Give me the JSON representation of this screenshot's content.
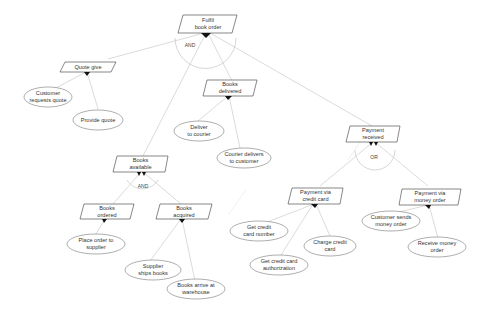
{
  "diagram": {
    "type": "goal-decomposition-tree",
    "goals": [
      {
        "id": "fulfil",
        "line1": "Fulfil",
        "line2": "book order"
      },
      {
        "id": "quote",
        "line1": "Quote give",
        "line2": ""
      },
      {
        "id": "delivered",
        "line1": "Books",
        "line2": "delivered"
      },
      {
        "id": "payment",
        "line1": "Payment",
        "line2": "received"
      },
      {
        "id": "available",
        "line1": "Books",
        "line2": "available"
      },
      {
        "id": "ordered",
        "line1": "Books",
        "line2": "ordered"
      },
      {
        "id": "acquired",
        "line1": "Books",
        "line2": "acquired"
      },
      {
        "id": "credit",
        "line1": "Payment via",
        "line2": "credit card"
      },
      {
        "id": "money",
        "line1": "Payment via",
        "line2": "money order"
      }
    ],
    "tasks": [
      {
        "id": "cust_req",
        "line1": "Customer",
        "line2": "requests quote"
      },
      {
        "id": "provide",
        "line1": "Provide quote",
        "line2": ""
      },
      {
        "id": "deliver",
        "line1": "Deliver",
        "line2": "to courier"
      },
      {
        "id": "courier",
        "line1": "Courier delivers",
        "line2": "to customer"
      },
      {
        "id": "place",
        "line1": "Place order to",
        "line2": "supplier"
      },
      {
        "id": "ships",
        "line1": "Supplier",
        "line2": "ships books"
      },
      {
        "id": "arrive",
        "line1": "Books arrive at",
        "line2": "warehouse"
      },
      {
        "id": "get_num",
        "line1": "Get credit",
        "line2": "card number"
      },
      {
        "id": "get_auth",
        "line1": "Get credit card",
        "line2": "authorization"
      },
      {
        "id": "charge",
        "line1": "Charge credit",
        "line2": "card"
      },
      {
        "id": "sends",
        "line1": "Customer sends",
        "line2": "money order"
      },
      {
        "id": "receive",
        "line1": "Receive money",
        "line2": "order"
      }
    ],
    "operators": {
      "top": "AND",
      "available": "AND",
      "payment": "OR"
    },
    "colors": {
      "line": "#cfcfcf",
      "border": "#555555",
      "arrow": "#111111",
      "text": "#333333"
    }
  }
}
